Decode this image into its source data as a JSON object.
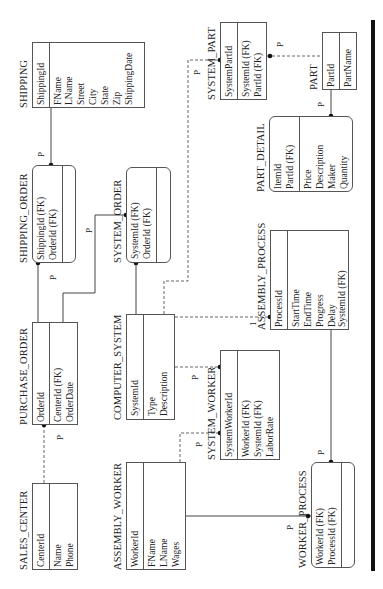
{
  "entities": {
    "shipping": {
      "title": "SHIPPING",
      "pk": [
        "ShippingId"
      ],
      "attrs": [
        "FName",
        "LName",
        "Street",
        "City",
        "State",
        "Zip",
        "ShippingDate"
      ]
    },
    "shipping_order": {
      "title": "SHIPPING_ORDER",
      "pk": [
        "ShippingId (FK)",
        "OrderId (FK)"
      ],
      "attrs": []
    },
    "system_order": {
      "title": "SYSTEM_ORDER",
      "pk": [
        "SystemId (FK)",
        "OrderId (FK)"
      ],
      "attrs": []
    },
    "purchase_order": {
      "title": "PURCHASE_ORDER",
      "pk": [
        "OrderId"
      ],
      "attrs": [
        "CenterId (FK)",
        "OrderDate"
      ]
    },
    "computer_system": {
      "title": "COMPUTER_SYSTEM",
      "pk": [
        "SystemId"
      ],
      "attrs": [
        "Type",
        "Description"
      ]
    },
    "sales_center": {
      "title": "SALES_CENTER",
      "pk": [
        "CenterId"
      ],
      "attrs": [
        "Name",
        "Phone"
      ]
    },
    "assembly_worker": {
      "title": "ASSEMBLY_WORKER",
      "pk": [
        "WorkerId"
      ],
      "attrs": [
        "FName",
        "LName",
        "Wages"
      ]
    },
    "system_worker": {
      "title": "SYSTEM_WORKER",
      "pk": [
        "SystemWorkerId"
      ],
      "attrs": [
        "WorkerId (FK)",
        "SystemId (FK)",
        "LaborRate"
      ]
    },
    "system_part": {
      "title": "SYSTEM_PART",
      "pk": [
        "SystemPartId"
      ],
      "attrs": [
        "SystemId (FK)",
        "PartId (FK)"
      ]
    },
    "part": {
      "title": "PART",
      "pk": [
        "PartId"
      ],
      "attrs": [
        "PartName"
      ]
    },
    "part_detail": {
      "title": "PART_DETAIL",
      "pk": [
        "ItemId",
        "PartId (FK)"
      ],
      "attrs": [
        "Price",
        "Description",
        "Maker",
        "Quantity"
      ]
    },
    "assembly_process": {
      "title": "ASSEMBLY_PROCESS",
      "pk": [
        "ProcessId"
      ],
      "attrs": [
        "StartTime",
        "EndTime",
        "Progress",
        "Delay",
        "SystemId (FK)"
      ]
    },
    "worker_process": {
      "title": "WORKER_PROCESS",
      "pk": [
        "WorkerId (FK)",
        "ProcessId (FK)"
      ],
      "attrs": []
    }
  },
  "cardinality_labels": {
    "p": "P",
    "one": "1"
  }
}
